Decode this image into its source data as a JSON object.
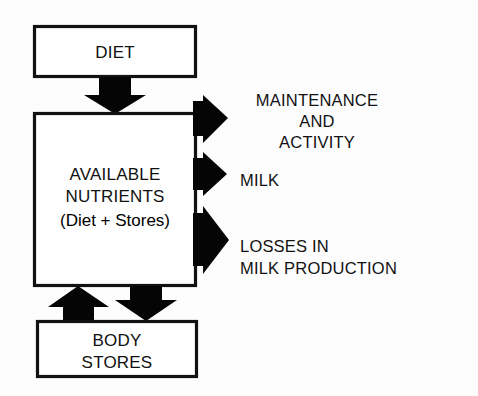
{
  "diagram": {
    "type": "flowchart",
    "colors": {
      "stroke": "#111111",
      "arrow_fill": "#050505",
      "box_fill": "#ffffff",
      "background": "#fdfdfd"
    },
    "nodes": [
      {
        "id": "diet",
        "name": "diet-box",
        "lines": [
          "DIET"
        ]
      },
      {
        "id": "available-nutrients",
        "name": "available-nutrients-box",
        "lines": [
          "AVAILABLE",
          "NUTRIENTS",
          "(Diet + Stores)"
        ]
      },
      {
        "id": "body-stores",
        "name": "body-stores-box",
        "lines": [
          "BODY",
          "STORES"
        ]
      }
    ],
    "outputs": [
      {
        "id": "maintenance-activity",
        "name": "maintenance-and-activity-label",
        "lines": [
          "MAINTENANCE",
          "AND",
          "ACTIVITY"
        ],
        "align": "centered"
      },
      {
        "id": "milk",
        "name": "milk-label",
        "lines": [
          "MILK"
        ],
        "align": "left"
      },
      {
        "id": "losses-in-milk-production",
        "name": "losses-in-milk-production-label",
        "lines": [
          "LOSSES IN",
          "MILK PRODUCTION"
        ],
        "align": "left"
      }
    ],
    "connectors": [
      {
        "id": "diet-to-nutrients",
        "name": "arrow-diet-to-available-nutrients",
        "direction": "down"
      },
      {
        "id": "nutrients-to-maintenance",
        "name": "arrow-to-maintenance-and-activity",
        "direction": "right"
      },
      {
        "id": "nutrients-to-milk",
        "name": "arrow-to-milk",
        "direction": "right"
      },
      {
        "id": "nutrients-to-losses",
        "name": "arrow-to-losses-in-milk-production",
        "direction": "right"
      },
      {
        "id": "stores-to-nutrients",
        "name": "arrow-body-stores-to-available-nutrients",
        "direction": "up"
      },
      {
        "id": "nutrients-to-stores",
        "name": "arrow-available-nutrients-to-body-stores",
        "direction": "down"
      }
    ]
  }
}
